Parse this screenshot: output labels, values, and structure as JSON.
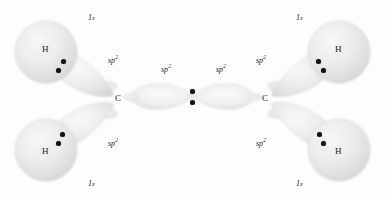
{
  "figure": {
    "background_color": "#fdfdfd",
    "orbital_fill_color": "#e8e8e8",
    "orbital_edge_color": "#cfcfcf",
    "electron_dot_color": "#111111",
    "label_color": "#1a1a1a"
  },
  "atoms": [
    {
      "id": "h-top-left",
      "label": "H",
      "x": 46,
      "y": 50
    },
    {
      "id": "h-bottom-left",
      "label": "H",
      "x": 46,
      "y": 152
    },
    {
      "id": "c-left",
      "label": "C",
      "x": 119,
      "y": 99
    },
    {
      "id": "c-right",
      "label": "C",
      "x": 266,
      "y": 99
    },
    {
      "id": "h-top-right",
      "label": "H",
      "x": 339,
      "y": 50
    },
    {
      "id": "h-bottom-right",
      "label": "H",
      "x": 339,
      "y": 152
    }
  ],
  "orbital_labels": [
    {
      "id": "1s-top-left",
      "text": "1s",
      "sup": "",
      "x": 88,
      "y": 14,
      "kind": "s"
    },
    {
      "id": "sp2-top-left",
      "text": "sp",
      "sup": "2",
      "x": 108,
      "y": 57,
      "kind": "sp2"
    },
    {
      "id": "sp2-center-left",
      "text": "sp",
      "sup": "2",
      "x": 161,
      "y": 66,
      "kind": "sp2"
    },
    {
      "id": "sp2-center-right",
      "text": "sp",
      "sup": "2",
      "x": 216,
      "y": 66,
      "kind": "sp2"
    },
    {
      "id": "sp2-top-right",
      "text": "sp",
      "sup": "2",
      "x": 256,
      "y": 57,
      "kind": "sp2"
    },
    {
      "id": "1s-top-right",
      "text": "1s",
      "sup": "",
      "x": 296,
      "y": 14,
      "kind": "s"
    },
    {
      "id": "1s-bottom-left",
      "text": "1s",
      "sup": "",
      "x": 88,
      "y": 180,
      "kind": "s"
    },
    {
      "id": "sp2-bottom-left",
      "text": "sp",
      "sup": "2",
      "x": 108,
      "y": 140,
      "kind": "sp2"
    },
    {
      "id": "sp2-bottom-right",
      "text": "sp",
      "sup": "2",
      "x": 256,
      "y": 140,
      "kind": "sp2"
    },
    {
      "id": "1s-bottom-right",
      "text": "1s",
      "sup": "",
      "x": 296,
      "y": 180,
      "kind": "s"
    }
  ],
  "bonds": [
    {
      "id": "sigma-c-h-top-left",
      "type": "sigma",
      "between": [
        "c-left",
        "h-top-left"
      ],
      "electron_count": 2,
      "dots": [
        {
          "x": 63,
          "y": 61
        },
        {
          "x": 58,
          "y": 70
        }
      ]
    },
    {
      "id": "sigma-c-h-bottom-left",
      "type": "sigma",
      "between": [
        "c-left",
        "h-bottom-left"
      ],
      "electron_count": 2,
      "dots": [
        {
          "x": 62,
          "y": 134
        },
        {
          "x": 58,
          "y": 143
        }
      ]
    },
    {
      "id": "sigma-c-c",
      "type": "sigma",
      "between": [
        "c-left",
        "c-right"
      ],
      "electron_count": 2,
      "dots": [
        {
          "x": 192,
          "y": 91
        },
        {
          "x": 192,
          "y": 102
        }
      ]
    },
    {
      "id": "sigma-c-h-top-right",
      "type": "sigma",
      "between": [
        "c-right",
        "h-top-right"
      ],
      "electron_count": 2,
      "dots": [
        {
          "x": 318,
          "y": 61
        },
        {
          "x": 323,
          "y": 70
        }
      ]
    },
    {
      "id": "sigma-c-h-bottom-right",
      "type": "sigma",
      "between": [
        "c-right",
        "h-bottom-right"
      ],
      "electron_count": 2,
      "dots": [
        {
          "x": 319,
          "y": 134
        },
        {
          "x": 323,
          "y": 143
        }
      ]
    }
  ]
}
